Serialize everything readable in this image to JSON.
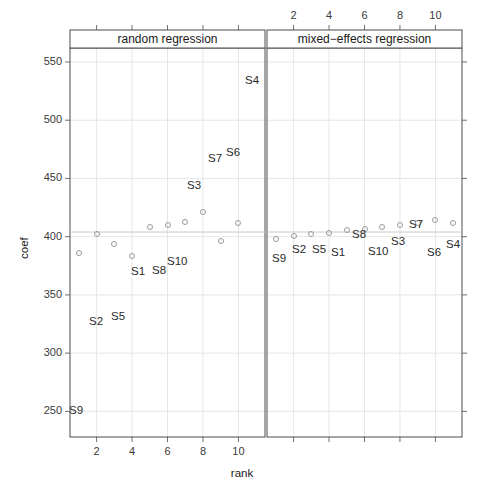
{
  "chart_data": {
    "type": "scatter",
    "title": "",
    "xlabel": "rank",
    "ylabel": "coef",
    "xlim": [
      0.5,
      11.5
    ],
    "ylim": [
      228,
      562
    ],
    "xticks": [
      2,
      4,
      6,
      8,
      10
    ],
    "yticks": [
      250,
      300,
      350,
      400,
      450,
      500,
      550
    ],
    "grid": true,
    "legend": "none",
    "panel_variable": "model",
    "panels": [
      {
        "name": "random regression",
        "strip_label": "random regression",
        "x_axis_labels_position": "bottom",
        "x": [
          1,
          2,
          3,
          4,
          5,
          6,
          7,
          8,
          9,
          10
        ],
        "y": [
          386,
          402,
          394,
          383,
          408,
          410,
          413,
          421,
          396,
          412
        ],
        "point_labels": [
          "S9",
          "S2",
          "S5",
          "S1",
          "S8",
          "S10",
          "S3",
          "S7",
          "S6",
          "S4"
        ],
        "label_positions": [
          {
            "label": "S9",
            "x": 69,
            "y": 404
          },
          {
            "label": "S2",
            "x": 89,
            "y": 315
          },
          {
            "label": "S5",
            "x": 111,
            "y": 310
          },
          {
            "label": "S1",
            "x": 131,
            "y": 265
          },
          {
            "label": "S8",
            "x": 152,
            "y": 264
          },
          {
            "label": "S10",
            "x": 167,
            "y": 255
          },
          {
            "label": "S3",
            "x": 187,
            "y": 179
          },
          {
            "label": "S7",
            "x": 208,
            "y": 152
          },
          {
            "label": "S6",
            "x": 226,
            "y": 146
          },
          {
            "label": "S4",
            "x": 245,
            "y": 74
          }
        ]
      },
      {
        "name": "mixed-effects regression",
        "strip_label": "mixed−effects regression",
        "x_axis_labels_position": "top",
        "x": [
          1,
          2,
          3,
          4,
          5,
          6,
          7,
          8,
          9,
          10,
          11
        ],
        "y": [
          398,
          401,
          402,
          403,
          406,
          407,
          408,
          410,
          412,
          414,
          412
        ],
        "point_labels": [
          "S9",
          "S2",
          "S5",
          "S1",
          "S8",
          "S10",
          "S3",
          "S7",
          "S6",
          "S4"
        ],
        "label_positions": [
          {
            "label": "S9",
            "x": 272,
            "y": 252
          },
          {
            "label": "S2",
            "x": 292,
            "y": 243
          },
          {
            "label": "S5",
            "x": 312,
            "y": 243
          },
          {
            "label": "S1",
            "x": 331,
            "y": 246
          },
          {
            "label": "S8",
            "x": 352,
            "y": 228
          },
          {
            "label": "S10",
            "x": 368,
            "y": 245
          },
          {
            "label": "S3",
            "x": 391,
            "y": 235
          },
          {
            "label": "S7",
            "x": 409,
            "y": 218
          },
          {
            "label": "S6",
            "x": 427,
            "y": 246
          },
          {
            "label": "S4",
            "x": 446,
            "y": 238
          }
        ]
      }
    ],
    "reference_line": {
      "orientation": "horizontal",
      "value": 404
    },
    "colors": {
      "point_stroke": "#9a9a9a",
      "grid": "#e6e6e6",
      "axis": "#6f6f6f",
      "frame": "#4d4d4d",
      "text": "#1a1a1a"
    }
  },
  "axes": {
    "y_title": "coef",
    "x_title": "rank",
    "y_tick_labels": [
      "550",
      "500",
      "450",
      "400",
      "350",
      "300",
      "250"
    ],
    "x_tick_labels_bottom": [
      "2",
      "4",
      "6",
      "8",
      "10"
    ],
    "x_tick_labels_top": [
      "2",
      "4",
      "6",
      "8",
      "10"
    ]
  },
  "strips": {
    "left": "random regression",
    "right": "mixed−effects regression"
  }
}
